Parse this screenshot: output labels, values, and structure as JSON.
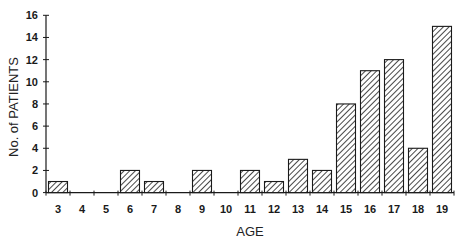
{
  "chart_data": {
    "type": "bar",
    "title": "",
    "xlabel": "AGE",
    "ylabel": "No. of PATIENTS",
    "categories": [
      "3",
      "4",
      "5",
      "6",
      "7",
      "8",
      "9",
      "10",
      "11",
      "12",
      "13",
      "14",
      "15",
      "16",
      "17",
      "18",
      "19"
    ],
    "values": [
      1,
      0,
      0,
      2,
      1,
      0,
      2,
      0,
      2,
      1,
      3,
      2,
      8,
      11,
      12,
      4,
      15
    ],
    "ylim": [
      0,
      16
    ],
    "yticks": [
      0,
      2,
      4,
      6,
      8,
      10,
      12,
      14,
      16
    ],
    "grid": false,
    "legend": null,
    "bar_fill": "diagonal-hatch",
    "colors": {
      "bar_stroke": "#1a1a1a",
      "hatch": "#1a1a1a",
      "background": "#ffffff"
    }
  }
}
